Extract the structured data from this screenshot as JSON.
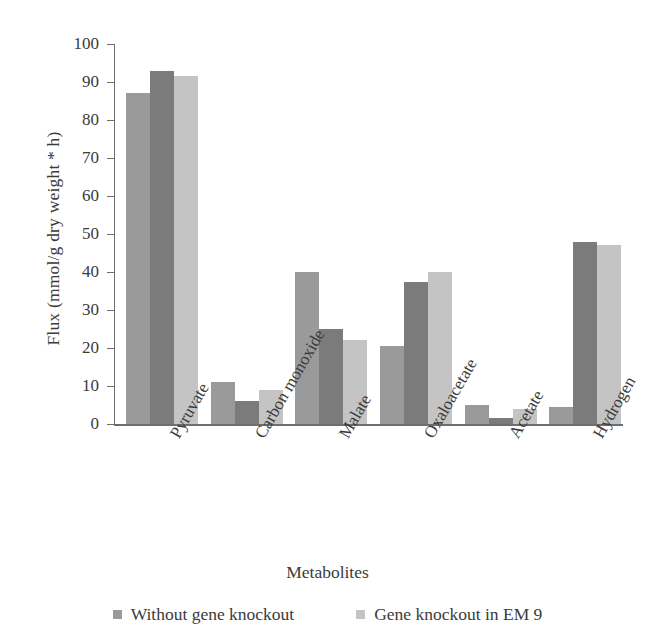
{
  "chart_data": {
    "type": "bar",
    "title": "",
    "xlabel": "Metabolites",
    "ylabel": "Flux (mmol/g dry weight * h)",
    "ylim": [
      0,
      100
    ],
    "yticks": [
      0,
      10,
      20,
      30,
      40,
      50,
      60,
      70,
      80,
      90,
      100
    ],
    "ytick_labels": [
      "0",
      "10",
      "20",
      "30",
      "40",
      "50",
      "60",
      "70",
      "80",
      "90",
      "100"
    ],
    "grid": false,
    "legend_position": "bottom",
    "categories": [
      "Pyruvate",
      "Carbon monoxide",
      "Malate",
      "Oxaloacetate",
      "Acetate",
      "Hydrogen"
    ],
    "series": [
      {
        "name": "Without gene knockout",
        "color": "#9a9a9a",
        "values": [
          87,
          11,
          40,
          20.5,
          5,
          4.5
        ]
      },
      {
        "name": "Gene knockout in EM 9",
        "color": "#7b7b7b",
        "values": [
          93,
          6,
          25,
          37.5,
          1.5,
          48
        ]
      },
      {
        "name": "",
        "color": "#c4c4c4",
        "values": [
          91.5,
          9,
          22,
          40,
          4,
          47
        ]
      }
    ],
    "legend": [
      {
        "label": "Without gene knockout",
        "color": "#9a9a9a"
      },
      {
        "label": "Gene knockout in EM 9",
        "color": "#c4c4c4"
      }
    ]
  },
  "colors": {
    "axis": "#6e6e6e",
    "text": "#3b3b3b",
    "background": "#ffffff",
    "series_1": "#9a9a9a",
    "series_2": "#7b7b7b",
    "series_3": "#c4c4c4"
  }
}
